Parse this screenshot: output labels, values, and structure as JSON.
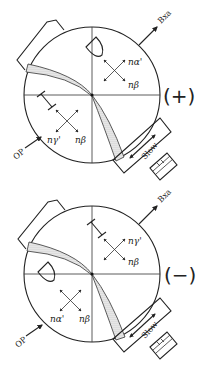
{
  "diagrams": [
    {
      "id": "positive",
      "sign_label": "(+)",
      "bxa_label": "Bxa",
      "op_label": "OP",
      "slow_label": "Slow",
      "upper_indicatrix": {
        "labels": [
          "nα'",
          "nβ"
        ]
      },
      "lower_indicatrix": {
        "labels": [
          "nγ'",
          "nβ"
        ]
      },
      "upper_symbol": "half-disc",
      "lower_symbol": "i-beam"
    },
    {
      "id": "negative",
      "sign_label": "(−)",
      "bxa_label": "Bxa",
      "op_label": "OP",
      "slow_label": "Slow",
      "upper_indicatrix": {
        "labels": [
          "nγ'",
          "nβ"
        ]
      },
      "lower_indicatrix": {
        "labels": [
          "nα'",
          "nβ"
        ]
      },
      "upper_symbol": "i-beam",
      "lower_symbol": "half-disc"
    }
  ]
}
